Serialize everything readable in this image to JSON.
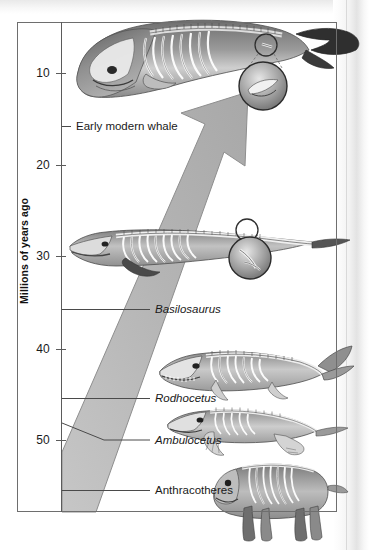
{
  "figure": {
    "axis": {
      "title": "Millions of years ago",
      "ticks": [
        {
          "value": "10",
          "y": 73
        },
        {
          "value": "20",
          "y": 165
        },
        {
          "value": "30",
          "y": 256
        },
        {
          "value": "40",
          "y": 349
        },
        {
          "value": "50",
          "y": 440
        }
      ],
      "range_mya": [
        5,
        57
      ],
      "orientation": "vertical-inverted"
    },
    "taxa": [
      {
        "label": "Early modern whale",
        "italic": false,
        "y": 126,
        "label_x": 76,
        "leader": "short",
        "leader_x2": 71
      },
      {
        "label": "Basilosaurus",
        "italic": true,
        "y": 309,
        "label_x": 155,
        "leader": "long",
        "leader_x2": 150
      },
      {
        "label": "Rodhocetus",
        "italic": true,
        "y": 398,
        "label_x": 155,
        "leader": "long",
        "leader_x2": 150
      },
      {
        "label": "Ambulocetus",
        "italic": true,
        "y": 440,
        "label_x": 155,
        "leader": "bent",
        "leader_x2": 150,
        "bend_y_start": 423,
        "bend_x": 104
      },
      {
        "label": "Anthracotheres",
        "italic": false,
        "y": 490,
        "label_x": 155,
        "leader": "long",
        "leader_x2": 150
      }
    ],
    "arrow": {
      "direction": "up-right",
      "fill_color": "#b9b9b9",
      "stroke_color": "#8e8e8e",
      "meaning": "evolutionary trend toward fully aquatic whales"
    },
    "magnifier_callouts": [
      {
        "subject": "ankle-bone-detail",
        "target_cx": 266,
        "target_cy": 45,
        "target_r": 11,
        "detail_cx": 263,
        "detail_cy": 86,
        "detail_r": 24
      },
      {
        "subject": "hindlimb-detail",
        "target_cx": 247,
        "target_cy": 230,
        "target_r": 11,
        "detail_cx": 250,
        "detail_cy": 258,
        "detail_r": 21
      }
    ],
    "colors": {
      "frame": "#6e6e6e",
      "axis": "#5b5b5b",
      "text": "#1a1a1a",
      "arrow_fill": "#b9b9b9",
      "paper": "#ffffff"
    }
  },
  "chart_data": {
    "type": "timeline",
    "xlabel": "",
    "ylabel": "Millions of years ago",
    "ylim": [
      57,
      5
    ],
    "yticks": [
      10,
      20,
      30,
      40,
      50
    ],
    "grid": false,
    "legend": "none",
    "categories": [
      "Early modern whale",
      "Basilosaurus",
      "Rodhocetus",
      "Ambulocetus",
      "Anthracotheres"
    ],
    "values": [
      11.3,
      36.3,
      45.9,
      50.4,
      55.8
    ],
    "annotations": [
      "Large gray arrow indicates evolutionary direction from terrestrial anthracotheres toward fully aquatic modern whales",
      "Magnifier inset on early modern whale shows vestigial pelvic/hindlimb bone",
      "Magnifier inset on Basilosaurus shows reduced hindlimb"
    ]
  }
}
